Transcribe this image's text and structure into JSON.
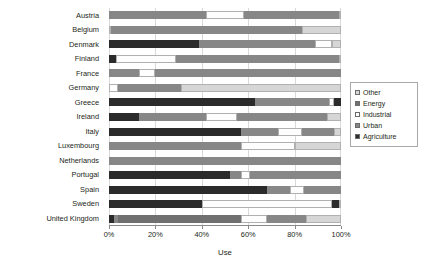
{
  "chart_data": {
    "type": "bar",
    "orientation": "horizontal",
    "stacked": true,
    "normalized": true,
    "title": "",
    "xlabel": "Use",
    "ylabel": "",
    "xlim": [
      0,
      100
    ],
    "xtick_labels": [
      "0%",
      "20%",
      "40%",
      "60%",
      "80%",
      "100%"
    ],
    "xtick_values": [
      0,
      20,
      40,
      60,
      80,
      100
    ],
    "grid": true,
    "legend_position": "right",
    "categories": [
      "Austria",
      "Belgium",
      "Denmark",
      "Finland",
      "France",
      "Germany",
      "Greece",
      "Ireland",
      "Italy",
      "Luxembourg",
      "Netherlands",
      "Portugal",
      "Spain",
      "Sweden",
      "United Kingdom"
    ],
    "series": [
      {
        "name": "Agriculture",
        "color": "#2b2b2b",
        "values": [
          9,
          1,
          39,
          4,
          13,
          5,
          52,
          31,
          57,
          0,
          2,
          53,
          68,
          40,
          2
        ]
      },
      {
        "name": "Urban",
        "color": "#878787",
        "values": [
          32,
          88,
          48,
          0,
          30,
          0,
          43,
          0,
          21,
          100,
          8,
          32,
          15,
          58,
          1
        ]
      },
      {
        "name": "Industrial",
        "color": "#fdfdfd",
        "values": [
          16,
          0,
          6,
          25,
          6,
          8,
          0,
          0,
          3,
          0,
          7,
          11,
          3,
          0,
          11
        ]
      },
      {
        "name": "Energy",
        "color": "#707070",
        "values": [
          43,
          0,
          0,
          70,
          51,
          29,
          2,
          68,
          19,
          0,
          82,
          0,
          13,
          0,
          54
        ]
      },
      {
        "name": "Other",
        "color": "#d6d6d6",
        "values": [
          0,
          11,
          7,
          1,
          0,
          58,
          3,
          1,
          0,
          0,
          1,
          4,
          1,
          2,
          32
        ]
      }
    ],
    "stack_order": [
      "Agriculture",
      "Urban",
      "Energy",
      "Industrial",
      "Urban",
      "Other"
    ],
    "bars": [
      {
        "category": "Austria",
        "segments": [
          {
            "series": "Urban",
            "start": 0,
            "end": 42
          },
          {
            "series": "Industrial",
            "start": 42,
            "end": 58
          },
          {
            "series": "Urban",
            "start": 58,
            "end": 99
          },
          {
            "series": "Other",
            "start": 99,
            "end": 100
          }
        ]
      },
      {
        "category": "Belgium",
        "segments": [
          {
            "series": "Other",
            "start": 0,
            "end": 1
          },
          {
            "series": "Urban",
            "start": 1,
            "end": 83
          },
          {
            "series": "Other",
            "start": 83,
            "end": 100
          }
        ]
      },
      {
        "category": "Denmark",
        "segments": [
          {
            "series": "Agriculture",
            "start": 0,
            "end": 39
          },
          {
            "series": "Urban",
            "start": 39,
            "end": 89
          },
          {
            "series": "Industrial",
            "start": 89,
            "end": 96
          },
          {
            "series": "Other",
            "start": 96,
            "end": 100
          }
        ]
      },
      {
        "category": "Finland",
        "segments": [
          {
            "series": "Agriculture",
            "start": 0,
            "end": 3
          },
          {
            "series": "Industrial",
            "start": 3,
            "end": 29
          },
          {
            "series": "Urban",
            "start": 29,
            "end": 99
          },
          {
            "series": "Other",
            "start": 99,
            "end": 100
          }
        ]
      },
      {
        "category": "France",
        "segments": [
          {
            "series": "Urban",
            "start": 0,
            "end": 13
          },
          {
            "series": "Industrial",
            "start": 13,
            "end": 20
          },
          {
            "series": "Urban",
            "start": 20,
            "end": 100
          }
        ]
      },
      {
        "category": "Germany",
        "segments": [
          {
            "series": "Industrial",
            "start": 0,
            "end": 4
          },
          {
            "series": "Urban",
            "start": 4,
            "end": 31
          },
          {
            "series": "Other",
            "start": 31,
            "end": 100
          }
        ]
      },
      {
        "category": "Greece",
        "segments": [
          {
            "series": "Agriculture",
            "start": 0,
            "end": 63
          },
          {
            "series": "Urban",
            "start": 63,
            "end": 95
          },
          {
            "series": "Industrial",
            "start": 95,
            "end": 97
          },
          {
            "series": "Agriculture",
            "start": 97,
            "end": 100
          }
        ]
      },
      {
        "category": "Ireland",
        "segments": [
          {
            "series": "Agriculture",
            "start": 0,
            "end": 13
          },
          {
            "series": "Urban",
            "start": 13,
            "end": 42
          },
          {
            "series": "Industrial",
            "start": 42,
            "end": 55
          },
          {
            "series": "Urban",
            "start": 55,
            "end": 94
          },
          {
            "series": "Other",
            "start": 94,
            "end": 100
          }
        ]
      },
      {
        "category": "Italy",
        "segments": [
          {
            "series": "Agriculture",
            "start": 0,
            "end": 57
          },
          {
            "series": "Urban",
            "start": 57,
            "end": 73
          },
          {
            "series": "Industrial",
            "start": 73,
            "end": 83
          },
          {
            "series": "Urban",
            "start": 83,
            "end": 97
          },
          {
            "series": "Other",
            "start": 97,
            "end": 100
          }
        ]
      },
      {
        "category": "Luxembourg",
        "segments": [
          {
            "series": "Urban",
            "start": 0,
            "end": 57
          },
          {
            "series": "Industrial",
            "start": 57,
            "end": 80
          },
          {
            "series": "Other",
            "start": 80,
            "end": 100
          }
        ]
      },
      {
        "category": "Netherlands",
        "segments": [
          {
            "series": "Urban",
            "start": 0,
            "end": 100
          }
        ]
      },
      {
        "category": "Portugal",
        "segments": [
          {
            "series": "Agriculture",
            "start": 0,
            "end": 52
          },
          {
            "series": "Urban",
            "start": 52,
            "end": 57
          },
          {
            "series": "Industrial",
            "start": 57,
            "end": 61
          },
          {
            "series": "Urban",
            "start": 61,
            "end": 100
          }
        ]
      },
      {
        "category": "Spain",
        "segments": [
          {
            "series": "Agriculture",
            "start": 0,
            "end": 68
          },
          {
            "series": "Urban",
            "start": 68,
            "end": 78
          },
          {
            "series": "Industrial",
            "start": 78,
            "end": 84
          },
          {
            "series": "Urban",
            "start": 84,
            "end": 100
          }
        ]
      },
      {
        "category": "Sweden",
        "segments": [
          {
            "series": "Agriculture",
            "start": 0,
            "end": 40
          },
          {
            "series": "Industrial",
            "start": 40,
            "end": 96
          },
          {
            "series": "Agriculture",
            "start": 96,
            "end": 99
          },
          {
            "series": "Other",
            "start": 99,
            "end": 100
          }
        ]
      },
      {
        "category": "United Kingdom",
        "segments": [
          {
            "series": "Agriculture",
            "start": 0,
            "end": 2
          },
          {
            "series": "Urban",
            "start": 2,
            "end": 4
          },
          {
            "series": "Energy",
            "start": 4,
            "end": 57
          },
          {
            "series": "Industrial",
            "start": 57,
            "end": 68
          },
          {
            "series": "Urban",
            "start": 68,
            "end": 85
          },
          {
            "series": "Other",
            "start": 85,
            "end": 100
          }
        ]
      }
    ]
  },
  "legend": {
    "items": [
      {
        "label": "Other",
        "color": "#d6d6d6"
      },
      {
        "label": "Energy",
        "color": "#707070"
      },
      {
        "label": "Industrial",
        "color": "#fdfdfd"
      },
      {
        "label": "Urban",
        "color": "#878787"
      },
      {
        "label": "Agriculture",
        "color": "#2b2b2b"
      }
    ]
  },
  "colors": {
    "axis": "#898989",
    "gridline": "#d9d9d9",
    "text": "#231f20",
    "background": "#ffffff",
    "legend_border": "#a8a8a8"
  }
}
